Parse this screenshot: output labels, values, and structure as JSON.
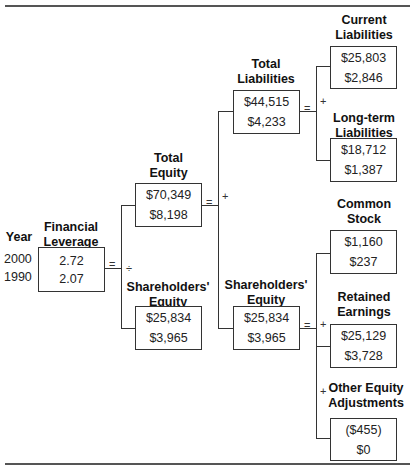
{
  "diagram": {
    "year_label": "Year",
    "years": [
      "2000",
      "1990"
    ],
    "operators": {
      "equals": "=",
      "divide": "÷",
      "plus": "+"
    },
    "nodes": {
      "financial_leverage": {
        "title": "Financial Leverage",
        "values": [
          "2.72",
          "2.07"
        ]
      },
      "total_equity": {
        "title": "Total Equity",
        "values": [
          "$70,349",
          "$8,198"
        ]
      },
      "shareholders_equity_left": {
        "title": "Shareholders' Equity",
        "values": [
          "$25,834",
          "$3,965"
        ]
      },
      "total_liabilities": {
        "title": "Total Liabilities",
        "values": [
          "$44,515",
          "$4,233"
        ]
      },
      "shareholders_equity_mid": {
        "title": "Shareholders' Equity",
        "values": [
          "$25,834",
          "$3,965"
        ]
      },
      "current_liabilities": {
        "title": "Current Liabilities",
        "values": [
          "$25,803",
          "$2,846"
        ]
      },
      "long_term_liabilities": {
        "title": "Long-term Liabilities",
        "values": [
          "$18,712",
          "$1,387"
        ]
      },
      "common_stock": {
        "title": "Common Stock",
        "values": [
          "$1,160",
          "$237"
        ]
      },
      "retained_earnings": {
        "title": "Retained Earnings",
        "values": [
          "$25,129",
          "$3,728"
        ]
      },
      "other_equity_adjustments": {
        "title": "Other Equity Adjustments",
        "values": [
          "($455)",
          "$0"
        ]
      }
    }
  }
}
